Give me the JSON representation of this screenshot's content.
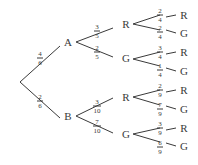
{
  "diagram": {
    "type": "probability-tree",
    "root": {
      "branches": [
        {
          "prob_num": "4",
          "prob_den": "6",
          "label": "A",
          "branches": [
            {
              "prob_num": "3",
              "prob_den": "5",
              "label": "R",
              "branches": [
                {
                  "prob_num": "2",
                  "prob_den": "4",
                  "label": "R"
                },
                {
                  "prob_num": "2",
                  "prob_den": "4",
                  "label": "G"
                }
              ]
            },
            {
              "prob_num": "2",
              "prob_den": "5",
              "label": "G",
              "branches": [
                {
                  "prob_num": "3",
                  "prob_den": "4",
                  "label": "R"
                },
                {
                  "prob_num": "1",
                  "prob_den": "4",
                  "label": "G"
                }
              ]
            }
          ]
        },
        {
          "prob_num": "2",
          "prob_den": "6",
          "label": "B",
          "branches": [
            {
              "prob_num": "3",
              "prob_den": "10",
              "label": "R",
              "branches": [
                {
                  "prob_num": "2",
                  "prob_den": "9",
                  "label": "R"
                },
                {
                  "prob_num": "7",
                  "prob_den": "9",
                  "label": "G"
                }
              ]
            },
            {
              "prob_num": "7",
              "prob_den": "10",
              "label": "G",
              "branches": [
                {
                  "prob_num": "3",
                  "prob_den": "9",
                  "label": "R"
                },
                {
                  "prob_num": "6",
                  "prob_den": "9",
                  "label": "G"
                }
              ]
            }
          ]
        }
      ]
    }
  }
}
